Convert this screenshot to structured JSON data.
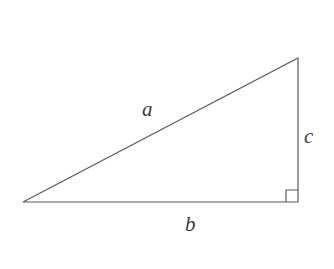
{
  "figure": {
    "background_color": "#ffffff",
    "stroke_color": "#5a5a5a",
    "label_color": "#3a3a3a",
    "stroke_width": 1.2,
    "vertices": {
      "left": [
        23,
        202
      ],
      "bottom_right": [
        298,
        202
      ],
      "top_right": [
        298,
        58
      ]
    },
    "sides": {
      "hypotenuse": {
        "label": "a",
        "from": [
          23,
          202
        ],
        "to": [
          298,
          58
        ]
      },
      "base": {
        "label": "b",
        "from": [
          23,
          202
        ],
        "to": [
          298,
          202
        ]
      },
      "vertical": {
        "label": "c",
        "from": [
          298,
          202
        ],
        "to": [
          298,
          58
        ]
      }
    },
    "right_angle_marker": {
      "name": "right-angle-square",
      "x": 286,
      "y": 190,
      "size": 12
    },
    "labels": {
      "hypotenuse": "a",
      "base": "b",
      "vertical": "c"
    }
  }
}
